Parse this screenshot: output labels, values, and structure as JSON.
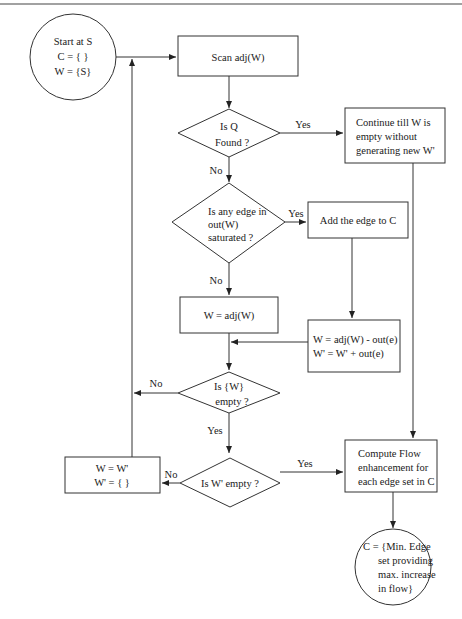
{
  "diagram": {
    "type": "flowchart",
    "nodes": {
      "start": {
        "shape": "circle",
        "lines": [
          "Start at S",
          "C = { }",
          "W = {S}"
        ]
      },
      "scan": {
        "shape": "rect",
        "lines": [
          "Scan  adj(W)"
        ]
      },
      "q_found": {
        "shape": "diamond",
        "lines": [
          "Is Q",
          "Found ?"
        ]
      },
      "continue": {
        "shape": "rect",
        "lines": [
          "Continue till W is",
          "empty without",
          "generating new W'"
        ]
      },
      "edge_saturated": {
        "shape": "diamond",
        "lines": [
          "Is any edge in",
          "out(W)",
          "saturated ?"
        ]
      },
      "add_edge": {
        "shape": "rect",
        "lines": [
          "Add the edge to C"
        ]
      },
      "w_adj": {
        "shape": "rect",
        "lines": [
          "W = adj(W)"
        ]
      },
      "w_update": {
        "shape": "rect",
        "lines": [
          "W = adj(W) - out(e)",
          "W' = W' + out(e)"
        ]
      },
      "w_empty": {
        "shape": "diamond",
        "lines": [
          "Is {W}",
          "empty ?"
        ]
      },
      "wprime_empty": {
        "shape": "diamond",
        "lines": [
          "Is W' empty ?"
        ]
      },
      "swap": {
        "shape": "rect",
        "lines": [
          "W = W'",
          "W' = { }"
        ]
      },
      "compute": {
        "shape": "rect",
        "lines": [
          "Compute Flow",
          "enhancement for",
          "each edge set in C"
        ]
      },
      "end": {
        "shape": "circle",
        "lines": [
          "C = {Min. Edge",
          "set providing",
          "max. increase",
          "in flow}"
        ]
      }
    },
    "edge_labels": {
      "q_yes": "Yes",
      "q_no": "No",
      "sat_yes": "Yes",
      "sat_no": "No",
      "w_empty_no": "No",
      "w_empty_yes": "Yes",
      "wprime_no": "No",
      "wprime_yes": "Yes"
    },
    "edges": [
      {
        "from": "start",
        "to": "scan"
      },
      {
        "from": "scan",
        "to": "q_found"
      },
      {
        "from": "q_found",
        "to": "continue",
        "label": "Yes"
      },
      {
        "from": "q_found",
        "to": "edge_saturated",
        "label": "No"
      },
      {
        "from": "edge_saturated",
        "to": "add_edge",
        "label": "Yes"
      },
      {
        "from": "edge_saturated",
        "to": "w_adj",
        "label": "No"
      },
      {
        "from": "add_edge",
        "to": "w_update"
      },
      {
        "from": "w_adj",
        "to": "w_empty"
      },
      {
        "from": "w_update",
        "to": "w_empty"
      },
      {
        "from": "w_empty",
        "to": "scan",
        "label": "No"
      },
      {
        "from": "w_empty",
        "to": "wprime_empty",
        "label": "Yes"
      },
      {
        "from": "wprime_empty",
        "to": "swap",
        "label": "No"
      },
      {
        "from": "wprime_empty",
        "to": "compute",
        "label": "Yes"
      },
      {
        "from": "swap",
        "to": "scan"
      },
      {
        "from": "continue",
        "to": "compute"
      },
      {
        "from": "compute",
        "to": "end"
      }
    ]
  }
}
